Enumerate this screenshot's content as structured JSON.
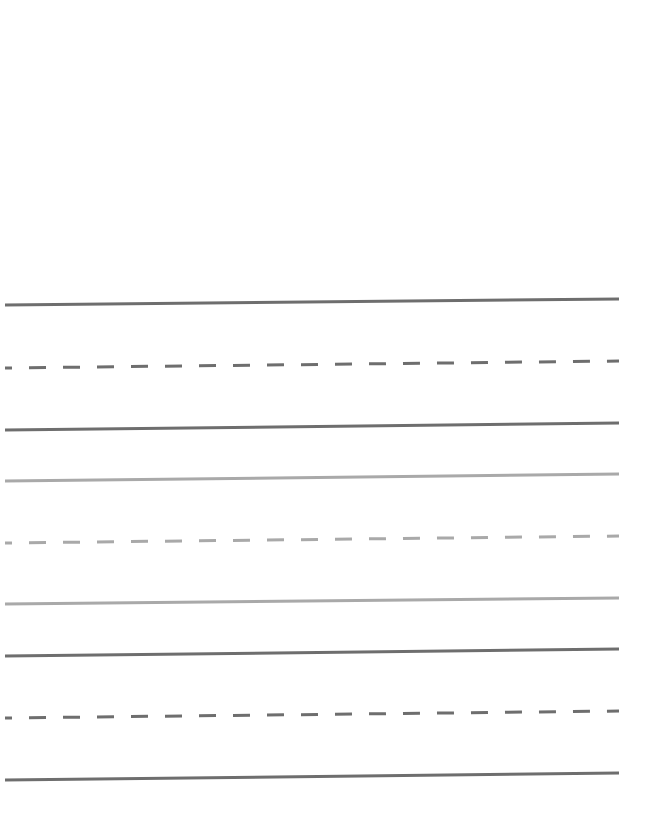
{
  "page": {
    "type": "handwriting-practice-sheet",
    "background": "#ffffff"
  },
  "colors": {
    "dark_line": "#6e6e6e",
    "light_line": "#a9a9a9"
  },
  "line_geometry": {
    "x_start": 5,
    "x_end": 619,
    "stroke_width": 3,
    "dash_length": 17,
    "dash_gap": 17
  },
  "line_groups": [
    {
      "name": "group-1",
      "color": "dark",
      "lines": [
        {
          "style": "solid",
          "y_left": 305,
          "y_right": 299
        },
        {
          "style": "dashed",
          "y_left": 368,
          "y_right": 361
        },
        {
          "style": "solid",
          "y_left": 430,
          "y_right": 423
        }
      ]
    },
    {
      "name": "group-2",
      "color": "light",
      "lines": [
        {
          "style": "solid",
          "y_left": 481,
          "y_right": 474
        },
        {
          "style": "dashed",
          "y_left": 543,
          "y_right": 536
        },
        {
          "style": "solid",
          "y_left": 604,
          "y_right": 598
        }
      ]
    },
    {
      "name": "group-3",
      "color": "dark",
      "lines": [
        {
          "style": "solid",
          "y_left": 656,
          "y_right": 649
        },
        {
          "style": "dashed",
          "y_left": 718,
          "y_right": 711
        },
        {
          "style": "solid",
          "y_left": 780,
          "y_right": 773
        }
      ]
    }
  ]
}
